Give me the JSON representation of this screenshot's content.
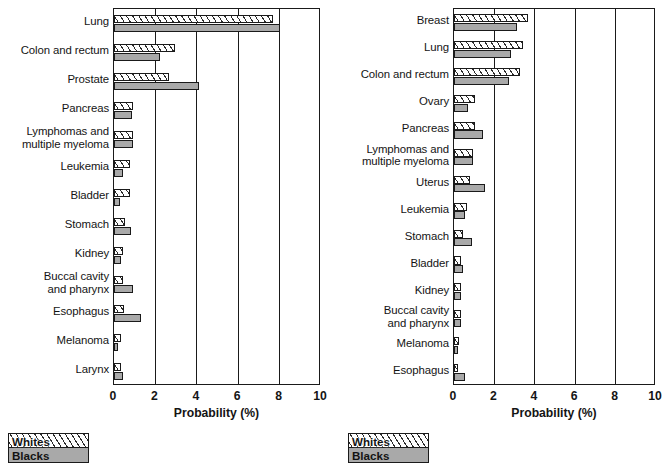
{
  "figure": {
    "legend": {
      "whites_label": "Whites",
      "blacks_label": "Blacks"
    },
    "colors": {
      "whites_fill": "#ffffff",
      "blacks_fill": "#a9a9a9",
      "outline": "#1a1a1a"
    }
  },
  "chart_data": [
    {
      "type": "bar",
      "orientation": "horizontal",
      "panel": "left",
      "title": "",
      "xlabel": "Probability (%)",
      "ylabel": "",
      "xlim": [
        0,
        10
      ],
      "xticks": [
        0,
        2,
        4,
        6,
        8,
        10
      ],
      "xticklabels": [
        "0",
        "2",
        "4",
        "6",
        "8",
        "10"
      ],
      "grid": true,
      "legend_position": "below-left",
      "categories": [
        "Lung",
        "Colon and rectum",
        "Prostate",
        "Pancreas",
        "Lymphomas and\nmultiple myeloma",
        "Leukemia",
        "Bladder",
        "Stomach",
        "Kidney",
        "Buccal cavity\nand pharynx",
        "Esophagus",
        "Melanoma",
        "Larynx"
      ],
      "series": [
        {
          "name": "Whites",
          "values": [
            7.7,
            2.95,
            2.65,
            0.9,
            0.92,
            0.77,
            0.77,
            0.55,
            0.42,
            0.45,
            0.48,
            0.34,
            0.35
          ]
        },
        {
          "name": "Blacks",
          "values": [
            8.0,
            2.2,
            4.1,
            0.87,
            0.9,
            0.45,
            0.29,
            0.84,
            0.32,
            0.9,
            1.29,
            0.1,
            0.42
          ]
        }
      ]
    },
    {
      "type": "bar",
      "orientation": "horizontal",
      "panel": "right",
      "title": "",
      "xlabel": "Probability (%)",
      "ylabel": "",
      "xlim": [
        0,
        10
      ],
      "xticks": [
        0,
        2,
        4,
        6,
        8,
        10
      ],
      "xticklabels": [
        "0",
        "2",
        "4",
        "6",
        "8",
        "10"
      ],
      "grid": true,
      "legend_position": "below-left",
      "categories": [
        "Breast",
        "Lung",
        "Colon and rectum",
        "Ovary",
        "Pancreas",
        "Lymphomas and\nmultiple myeloma",
        "Uterus",
        "Leukemia",
        "Stomach",
        "Bladder",
        "Kidney",
        "Buccal cavity\nand pharynx",
        "Melanoma",
        "Esophagus"
      ],
      "series": [
        {
          "name": "Whites",
          "values": [
            3.65,
            3.43,
            3.27,
            1.06,
            1.02,
            0.92,
            0.79,
            0.63,
            0.46,
            0.33,
            0.33,
            0.33,
            0.26,
            0.13
          ]
        },
        {
          "name": "Blacks",
          "values": [
            3.1,
            2.84,
            2.71,
            0.69,
            1.42,
            0.96,
            1.55,
            0.53,
            0.89,
            0.43,
            0.33,
            0.36,
            0.1,
            0.53
          ]
        }
      ]
    }
  ]
}
